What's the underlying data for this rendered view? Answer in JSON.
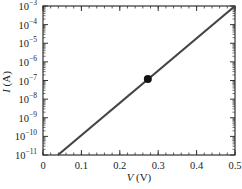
{
  "chart_data": {
    "type": "line",
    "title": "",
    "xlabel": "V (V)",
    "ylabel": "I (A)",
    "xlabel_var": "V",
    "xlabel_unit": "(V)",
    "ylabel_var": "I",
    "ylabel_unit": "(A)",
    "xlim": [
      0,
      0.5
    ],
    "ylim": [
      1e-11,
      0.001
    ],
    "yscale": "log",
    "grid": false,
    "x_ticks": [
      0,
      0.1,
      0.2,
      0.3,
      0.4,
      0.5
    ],
    "x_tick_labels": [
      "0",
      "0.1",
      "0.2",
      "0.3",
      "0.4",
      "0.5"
    ],
    "y_tick_exponents": [
      -11,
      -10,
      -9,
      -8,
      -7,
      -6,
      -5,
      -4,
      -3
    ],
    "series": [
      {
        "name": "I-V curve",
        "color": "#444444",
        "x": [
          0.039,
          0.5
        ],
        "y": [
          1e-11,
          0.001
        ]
      }
    ],
    "markers": [
      {
        "name": "operating point",
        "x": 0.273,
        "y": 1.2e-07,
        "color": "#111111"
      }
    ]
  }
}
